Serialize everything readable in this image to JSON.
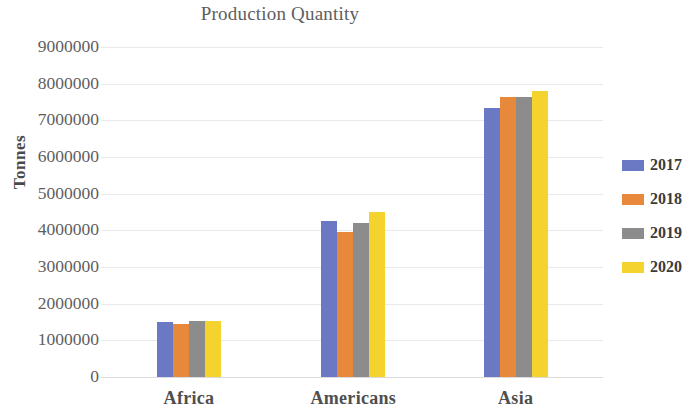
{
  "chart_data": {
    "type": "bar",
    "title": "Production Quantity",
    "xlabel": "",
    "ylabel": "Tonnes",
    "categories": [
      "Africa",
      "Americans",
      "Asia"
    ],
    "series": [
      {
        "name": "2017",
        "color": "#6B78C4",
        "values": [
          1500000,
          4250000,
          7350000
        ]
      },
      {
        "name": "2018",
        "color": "#E8883A",
        "values": [
          1450000,
          3950000,
          7650000
        ]
      },
      {
        "name": "2019",
        "color": "#8C8C8C",
        "values": [
          1520000,
          4200000,
          7650000
        ]
      },
      {
        "name": "2020",
        "color": "#F5D32E",
        "values": [
          1520000,
          4500000,
          7800000
        ]
      }
    ],
    "ylim": [
      0,
      9000000
    ],
    "y_ticks": [
      "9000000",
      "8000000",
      "7000000",
      "6000000",
      "5000000",
      "4000000",
      "3000000",
      "2000000",
      "1000000",
      "0"
    ],
    "y_tick_values": [
      9000000,
      8000000,
      7000000,
      6000000,
      5000000,
      4000000,
      3000000,
      2000000,
      1000000,
      0
    ],
    "grid": true,
    "legend_position": "right",
    "legend": [
      "2017",
      "2018",
      "2019",
      "2020"
    ]
  }
}
